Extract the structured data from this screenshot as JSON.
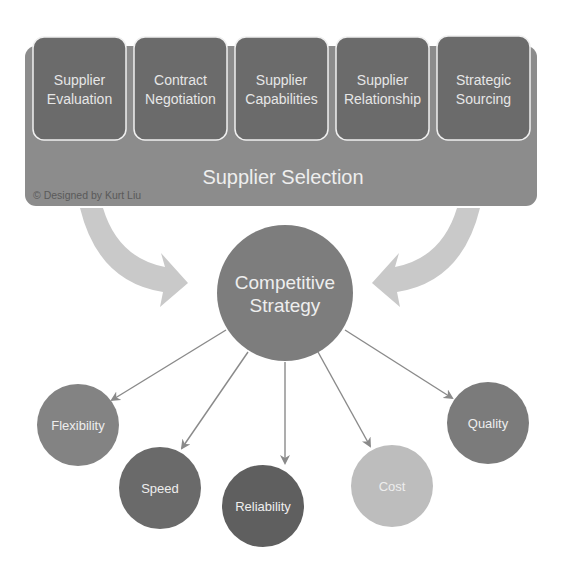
{
  "diagram": {
    "title": "Supplier Selection",
    "credit": "© Designed by Kurt Liu",
    "colors": {
      "band": "#8c8c8c",
      "tile": "#6b6b6b",
      "tile_border": "#f0f0f0",
      "curved_arrow": "#c9c9c9",
      "center": "#7d7d7d",
      "connector": "#8a8a8a"
    },
    "tiles": [
      {
        "line1": "Supplier",
        "line2": "Evaluation"
      },
      {
        "line1": "Contract",
        "line2": "Negotiation"
      },
      {
        "line1": "Supplier",
        "line2": "Capabilities"
      },
      {
        "line1": "Supplier",
        "line2": "Relationship"
      },
      {
        "line1": "Strategic",
        "line2": "Sourcing"
      }
    ],
    "center": {
      "line1": "Competitive",
      "line2": "Strategy"
    },
    "outcomes": [
      {
        "label": "Flexibility",
        "color": "#838383"
      },
      {
        "label": "Speed",
        "color": "#6a6a6a"
      },
      {
        "label": "Reliability",
        "color": "#5f5f5f"
      },
      {
        "label": "Cost",
        "color": "#bdbdbd"
      },
      {
        "label": "Quality",
        "color": "#7b7b7b"
      }
    ]
  }
}
